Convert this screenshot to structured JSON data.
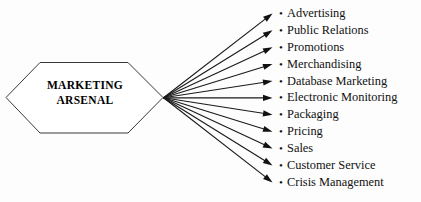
{
  "diagram": {
    "type": "fan-out-radial-diagram",
    "title_shape": "hexagon",
    "center": {
      "label_line_1": "MARKETING",
      "label_line_2": "ARSENAL"
    },
    "bullet_glyph": "•",
    "colors": {
      "background": "#fdfdfd",
      "shape_fill": "#ffffff",
      "shape_stroke": "#3a3a3a",
      "line": "#1a1a1a",
      "arrow_head": "#111111",
      "text": "#111111"
    },
    "branches": [
      {
        "label": "Advertising"
      },
      {
        "label": "Public Relations"
      },
      {
        "label": "Promotions"
      },
      {
        "label": "Merchandising"
      },
      {
        "label": "Database Marketing"
      },
      {
        "label": "Electronic Monitoring"
      },
      {
        "label": "Packaging"
      },
      {
        "label": "Pricing"
      },
      {
        "label": "Sales"
      },
      {
        "label": "Customer Service"
      },
      {
        "label": "Crisis Management"
      }
    ]
  }
}
